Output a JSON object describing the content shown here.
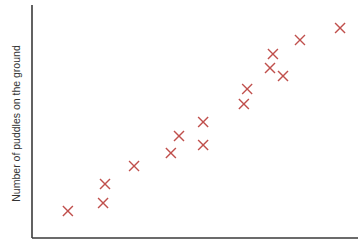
{
  "chart_data": {
    "type": "scatter",
    "title": "",
    "xlabel": "",
    "ylabel": "Number of puddles on the ground",
    "xlim": [
      0,
      100
    ],
    "ylim": [
      0,
      100
    ],
    "grid": false,
    "legend": null,
    "ticks_shown": false,
    "marker": "x",
    "marker_color": "#c0504d",
    "axis_color": "#3a3a3a",
    "series": [
      {
        "name": "observations",
        "points": [
          {
            "x": 11.0,
            "y": 11.6
          },
          {
            "x": 21.8,
            "y": 15.0
          },
          {
            "x": 22.4,
            "y": 23.2
          },
          {
            "x": 31.3,
            "y": 30.9
          },
          {
            "x": 42.6,
            "y": 36.5
          },
          {
            "x": 45.1,
            "y": 43.8
          },
          {
            "x": 52.5,
            "y": 39.9
          },
          {
            "x": 52.5,
            "y": 49.8
          },
          {
            "x": 65.0,
            "y": 57.5
          },
          {
            "x": 66.0,
            "y": 63.9
          },
          {
            "x": 73.0,
            "y": 73.0
          },
          {
            "x": 73.9,
            "y": 79.0
          },
          {
            "x": 77.0,
            "y": 69.5
          },
          {
            "x": 82.2,
            "y": 85.0
          },
          {
            "x": 94.5,
            "y": 90.1
          }
        ]
      }
    ]
  }
}
